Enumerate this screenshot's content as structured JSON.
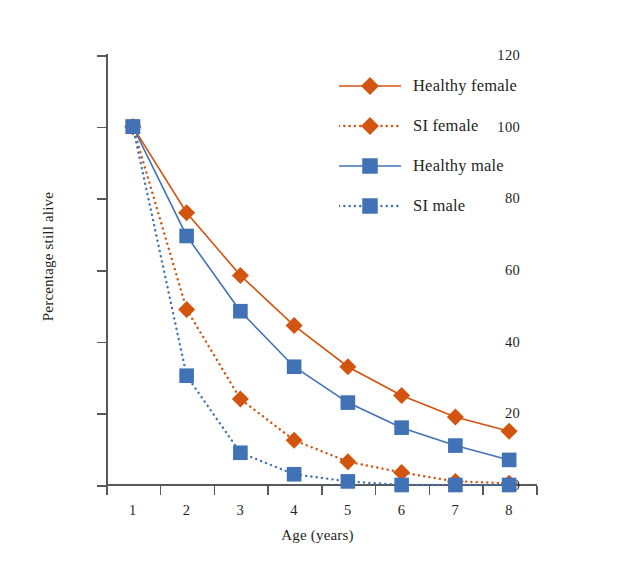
{
  "chart_data": {
    "type": "line",
    "title": "",
    "xlabel": "Age (years)",
    "ylabel": "Percentage still alive",
    "categories": [
      1,
      2,
      3,
      4,
      5,
      6,
      7,
      8
    ],
    "x_tick_labels": [
      "1",
      "2",
      "3",
      "4",
      "5",
      "6",
      "7",
      "8"
    ],
    "y_tick_labels": [
      "0",
      "20",
      "40",
      "60",
      "80",
      "100",
      "120"
    ],
    "y_ticks": [
      0,
      20,
      40,
      60,
      80,
      100,
      120
    ],
    "ylim": [
      0,
      120
    ],
    "grid": false,
    "legend_position": "upper right",
    "series": [
      {
        "name": "Healthy female",
        "values": [
          100,
          76,
          58.5,
          44.5,
          33,
          25,
          19,
          15
        ],
        "color": "#d2540f",
        "marker": "diamond",
        "linestyle": "solid"
      },
      {
        "name": "SI female",
        "values": [
          100,
          49,
          24,
          12.5,
          6.5,
          3.5,
          1,
          0.5
        ],
        "color": "#d2540f",
        "marker": "diamond",
        "linestyle": "dotted"
      },
      {
        "name": "Healthy male",
        "values": [
          100,
          69.5,
          48.5,
          33,
          23,
          16,
          11,
          7
        ],
        "color": "#4272b6",
        "marker": "square",
        "linestyle": "solid"
      },
      {
        "name": "SI male",
        "values": [
          100,
          30.5,
          9,
          3,
          1,
          0,
          0,
          0
        ],
        "color": "#4272b6",
        "marker": "square",
        "linestyle": "dotted"
      }
    ]
  },
  "colors": {
    "orange": "#d2540f",
    "blue": "#4272b6",
    "axis": "#58595b",
    "text": "#231f20",
    "background": "#ffffff"
  },
  "legend": {
    "items": [
      {
        "label": "Healthy female"
      },
      {
        "label": "SI female"
      },
      {
        "label": "Healthy male"
      },
      {
        "label": "SI male"
      }
    ]
  }
}
